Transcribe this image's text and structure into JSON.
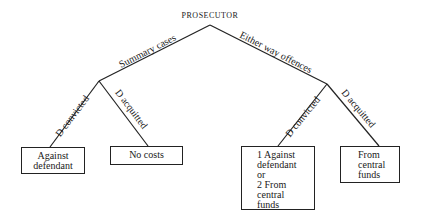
{
  "diagram": {
    "root": "PROSECUTOR",
    "branches": [
      {
        "label": "Summary cases",
        "children": [
          {
            "edge": "D convicted",
            "outcome": [
              "Against",
              "defendant"
            ]
          },
          {
            "edge": "D acquitted",
            "outcome": [
              "No costs"
            ]
          }
        ]
      },
      {
        "label": "Either way offences",
        "children": [
          {
            "edge": "D convicted",
            "outcome": [
              "1 Against",
              "defendant",
              "or",
              "2 From",
              "central",
              "funds"
            ]
          },
          {
            "edge": "D acquitted",
            "outcome": [
              "From",
              "central",
              "funds"
            ]
          }
        ]
      }
    ]
  },
  "colors": {
    "line": "#222222",
    "text": "#1a1a1a",
    "background": "#ffffff"
  }
}
